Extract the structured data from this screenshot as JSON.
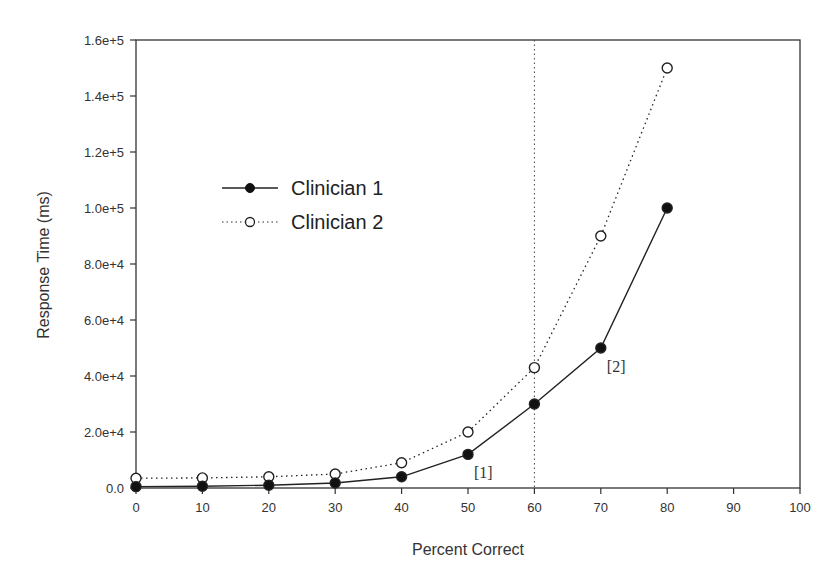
{
  "chart_data": {
    "type": "line",
    "title": "",
    "xlabel": "Percent Correct",
    "ylabel": "Response Time (ms)",
    "xlim": [
      0,
      100
    ],
    "ylim": [
      0,
      160000
    ],
    "x_ticks": [
      0,
      10,
      20,
      30,
      40,
      50,
      60,
      70,
      80,
      90,
      100
    ],
    "x_tick_labels": [
      "0",
      "10",
      "20",
      "30",
      "40",
      "50",
      "60",
      "70",
      "80",
      "90",
      "100"
    ],
    "y_ticks": [
      0,
      20000,
      40000,
      60000,
      80000,
      100000,
      120000,
      140000,
      160000
    ],
    "y_tick_labels": [
      "0.0",
      "2.0e+4",
      "4.0e+4",
      "6.0e+4",
      "8.0e+4",
      "1.0e+5",
      "1.2e+5",
      "1.4e+5",
      "1.6e+5"
    ],
    "grid": false,
    "legend_position": "upper-left (inside plot)",
    "x": [
      0,
      10,
      20,
      30,
      40,
      50,
      60,
      70,
      80
    ],
    "series": [
      {
        "name": "Clinician 1",
        "line_style": "solid",
        "marker": "filled-circle",
        "values": [
          500,
          600,
          1000,
          1800,
          4000,
          12000,
          30000,
          50000,
          100000
        ]
      },
      {
        "name": "Clinician 2",
        "line_style": "dotted",
        "marker": "open-circle",
        "values": [
          3500,
          3600,
          4000,
          5000,
          9000,
          20000,
          43000,
          90000,
          150000
        ]
      }
    ],
    "reference_lines": [
      {
        "orientation": "vertical",
        "x": 60,
        "style": "dotted"
      }
    ],
    "annotations": [
      {
        "text": "[1]",
        "x": 50,
        "y": 12000
      },
      {
        "text": "[2]",
        "x": 70,
        "y": 50000
      }
    ]
  }
}
